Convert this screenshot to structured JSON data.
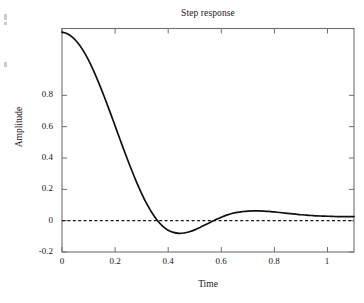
{
  "figure": {
    "title": "Step response",
    "xlabel": "Time",
    "ylabel": "Amplitude",
    "background_color": "#ffffff",
    "axis_color": "#6f6f6f",
    "curve_color": "#111111",
    "zero_line_color": "#1a1a1a"
  },
  "axes": {
    "x_ticks": [
      "0",
      "0.2",
      "0.4",
      "0.6",
      "0.8",
      "1"
    ],
    "y_ticks": [
      "-0.2",
      "0",
      "0.2",
      "0.4",
      "0.6",
      "0.8"
    ]
  },
  "chart_data": {
    "type": "line",
    "title": "Step response",
    "xlabel": "Time",
    "ylabel": "Amplitude",
    "xlim": [
      0,
      1.1
    ],
    "ylim": [
      -0.2,
      1.0
    ],
    "xticks": [
      0,
      0.2,
      0.4,
      0.6,
      0.8,
      1
    ],
    "yticks": [
      -0.2,
      0,
      0.2,
      0.4,
      0.6,
      0.8
    ],
    "grid": false,
    "legend": null,
    "annotations": [
      {
        "label": "zero reference line",
        "type": "horizontal-dashed-line",
        "y": 0
      }
    ],
    "series": [
      {
        "name": "Step response",
        "style": "solid",
        "color": "#111111",
        "x": [
          0.0,
          0.02,
          0.04,
          0.06,
          0.08,
          0.1,
          0.12,
          0.14,
          0.16,
          0.18,
          0.2,
          0.22,
          0.24,
          0.26,
          0.28,
          0.3,
          0.32,
          0.34,
          0.36,
          0.38,
          0.4,
          0.42,
          0.44,
          0.46,
          0.48,
          0.5,
          0.52,
          0.54,
          0.56,
          0.58,
          0.6,
          0.62,
          0.64,
          0.66,
          0.68,
          0.7,
          0.72,
          0.74,
          0.76,
          0.78,
          0.8,
          0.82,
          0.84,
          0.86,
          0.88,
          0.9,
          0.92,
          0.94,
          0.96,
          0.98,
          1.0,
          1.02,
          1.04,
          1.06,
          1.08,
          1.1
        ],
        "y": [
          0.98,
          0.972,
          0.952,
          0.922,
          0.881,
          0.83,
          0.77,
          0.703,
          0.631,
          0.555,
          0.477,
          0.399,
          0.322,
          0.248,
          0.178,
          0.114,
          0.057,
          0.008,
          -0.032,
          -0.062,
          -0.083,
          -0.095,
          -0.1,
          -0.098,
          -0.091,
          -0.081,
          -0.068,
          -0.054,
          -0.04,
          -0.026,
          -0.013,
          -0.002,
          0.007,
          0.013,
          0.017,
          0.02,
          0.021,
          0.021,
          0.02,
          0.018,
          0.015,
          0.012,
          0.009,
          0.006,
          0.003,
          0.0,
          -0.002,
          -0.004,
          -0.006,
          -0.007,
          -0.008,
          -0.009,
          -0.01,
          -0.01,
          -0.01,
          -0.01
        ],
        "key_points": {
          "initial_value": 0.98,
          "minimum": {
            "x": 0.37,
            "y": -0.17
          },
          "zero_crossing_down": 0.245,
          "zero_crossing_up": 0.605,
          "overshoot_peak": {
            "x": 0.72,
            "y": 0.021
          },
          "final_value": -0.01
        }
      }
    ]
  }
}
